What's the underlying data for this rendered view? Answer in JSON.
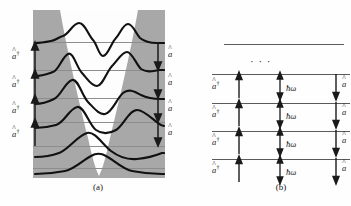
{
  "figure": {
    "kind": "physics-diagram",
    "colors": {
      "forbidden_region_fill": "#a8a8a8",
      "allowed_region_fill": "#fdfdfd",
      "level_line_a": "#8d8d8d",
      "level_line_b": "#5a5a5a",
      "wavefunction_stroke": "#111111",
      "arrow_stroke": "#1a1a1a",
      "text": "#161616",
      "background": "#ffffff"
    }
  },
  "panel_a": {
    "caption": "(a)",
    "description": "harmonic oscillator potential with six energy eigenstates and their wavefunctions",
    "raise_operator_label": "a",
    "raise_operator_dagger": "†",
    "lower_operator_label": "a",
    "hat_glyph": "^",
    "raise_labels": [
      {
        "base": "a",
        "sup": "†",
        "hat": "^"
      },
      {
        "base": "a",
        "sup": "†",
        "hat": "^"
      },
      {
        "base": "a",
        "sup": "†",
        "hat": "^"
      },
      {
        "base": "a",
        "sup": "†",
        "hat": "^"
      }
    ],
    "lower_labels": [
      {
        "base": "a",
        "sup": "",
        "hat": "^"
      },
      {
        "base": "a",
        "sup": "",
        "hat": "^"
      },
      {
        "base": "a",
        "sup": "",
        "hat": "^"
      },
      {
        "base": "a",
        "sup": "",
        "hat": "^"
      }
    ],
    "levels": [
      {
        "n": 5,
        "nodes": 5
      },
      {
        "n": 4,
        "nodes": 4
      },
      {
        "n": 3,
        "nodes": 3
      },
      {
        "n": 2,
        "nodes": 2
      },
      {
        "n": 1,
        "nodes": 1
      },
      {
        "n": 0,
        "nodes": 0
      }
    ]
  },
  "panel_b": {
    "caption": "(b)",
    "description": "energy level ladder with uniform spacing h-bar omega",
    "ellipsis": "· · ·",
    "gap_label": "ħω",
    "gap_labels": [
      "ħω",
      "ħω",
      "ħω",
      "ħω"
    ],
    "raise_labels": [
      {
        "base": "a",
        "sup": "†",
        "hat": "^"
      },
      {
        "base": "a",
        "sup": "†",
        "hat": "^"
      },
      {
        "base": "a",
        "sup": "†",
        "hat": "^"
      },
      {
        "base": "a",
        "sup": "†",
        "hat": "^"
      }
    ],
    "lower_labels": [
      {
        "base": "a",
        "sup": "",
        "hat": "^"
      },
      {
        "base": "a",
        "sup": "",
        "hat": "^"
      },
      {
        "base": "a",
        "sup": "",
        "hat": "^"
      },
      {
        "base": "a",
        "sup": "",
        "hat": "^"
      }
    ],
    "level_count": 5
  }
}
